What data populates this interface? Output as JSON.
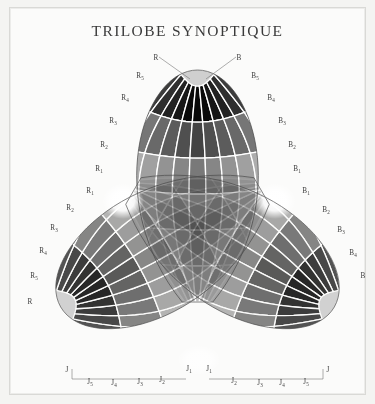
{
  "title": "TRILOBE SYNOPTIQUE",
  "figure": {
    "name": "trilobe-synoptique-diagram",
    "background_color": "#fbfbfa",
    "frame_color": "#d9d9d6",
    "grid_line_color": "#ffffff",
    "outline_color": "#555555",
    "lobes": [
      {
        "id": "lobe-R",
        "letter": "R",
        "name": "rouge-lobe",
        "orientation_deg": -90,
        "highlight": "white-specular-spot",
        "labels_outer": [
          "R",
          "R5",
          "R4",
          "R3",
          "R2",
          "R1"
        ],
        "labels_inner": [
          "R1",
          "R2",
          "R3",
          "R4",
          "R5",
          "R"
        ]
      },
      {
        "id": "lobe-B",
        "letter": "B",
        "name": "bleu-lobe",
        "orientation_deg": 30,
        "highlight": "white-specular-spot",
        "labels_outer": [
          "B",
          "B5",
          "B4",
          "B3",
          "B2",
          "B1"
        ],
        "labels_inner": [
          "B1",
          "B2",
          "B3",
          "B4",
          "B5",
          "B"
        ]
      },
      {
        "id": "lobe-J",
        "letter": "J",
        "name": "jaune-lobe",
        "orientation_deg": 150,
        "highlight": "white-specular-spot",
        "labels_outer": [
          "J",
          "J5",
          "J4",
          "J3",
          "J2",
          "J1"
        ],
        "labels_inner": [
          "J1",
          "J2",
          "J3",
          "J4",
          "J5",
          "J"
        ]
      }
    ],
    "labels": {
      "top_left_apex": "R",
      "top_right_apex": "B",
      "left_upper_series": [
        "R5",
        "R4",
        "R3",
        "R2",
        "R1"
      ],
      "left_lower_series": [
        "R1",
        "R2",
        "R3",
        "R4",
        "R5",
        "R"
      ],
      "right_upper_series": [
        "B5",
        "B4",
        "B3",
        "B2",
        "B1"
      ],
      "right_lower_series": [
        "B1",
        "B2",
        "B3",
        "B4",
        "B"
      ],
      "bottom_left_series": [
        "J",
        "J5",
        "J4",
        "J3",
        "J2",
        "J1"
      ],
      "bottom_right_series": [
        "J1",
        "J2",
        "J3",
        "J4",
        "J5",
        "J"
      ]
    },
    "scale_steps": 6,
    "grid_rows": 6,
    "grid_cols": 11
  }
}
